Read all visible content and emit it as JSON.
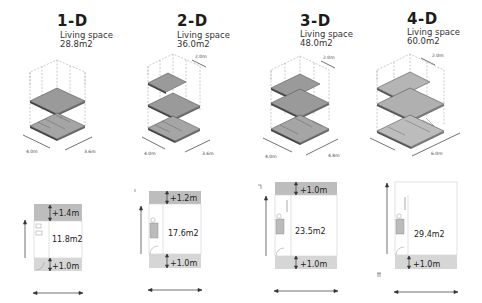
{
  "units": [
    {
      "id": "1-D",
      "title": "1-D",
      "living_label": "Living space",
      "living_area": "28.8m2",
      "iso_dims": {
        "depth": "4.0m",
        "width": "3.6m"
      },
      "floors": 2,
      "plan": {
        "area": "11.8m2",
        "top_offset": "+1.4m",
        "bottom_offset": "+1.0m"
      }
    },
    {
      "id": "2-D",
      "title": "2-D",
      "living_label": "Living space",
      "living_area": "36.0m2",
      "iso_dims": {
        "depth": "4.0m",
        "width": "3.6m",
        "extension": "2.0m"
      },
      "floors": 3,
      "plan": {
        "area": "17.6m2",
        "top_offset": "+1.2m",
        "bottom_offset": "+1.0m"
      }
    },
    {
      "id": "3-D",
      "title": "3-D",
      "living_label": "Living space",
      "living_area": "48.0m2",
      "iso_dims": {
        "depth": "4.0m",
        "width": "4.8m",
        "extension": "2.0m"
      },
      "floors": 3,
      "plan": {
        "area": "23.5m2",
        "top_offset": "+1.0m",
        "bottom_offset": "+1.0m"
      }
    },
    {
      "id": "4-D",
      "title": "4-D",
      "living_label": "Living space",
      "living_area": "60.0m2",
      "iso_dims": {
        "width": "6.0m",
        "extension": "2.0m"
      },
      "floors": 3,
      "plan": {
        "area": "29.4m2",
        "top_offset": "",
        "bottom_offset": "+1.0m"
      }
    }
  ],
  "colors": {
    "slab": "#9a9a9a",
    "slab_light": "#b5b5b5",
    "terrace": "#c8c8c8",
    "line": "#555555",
    "dash": "#999999"
  }
}
